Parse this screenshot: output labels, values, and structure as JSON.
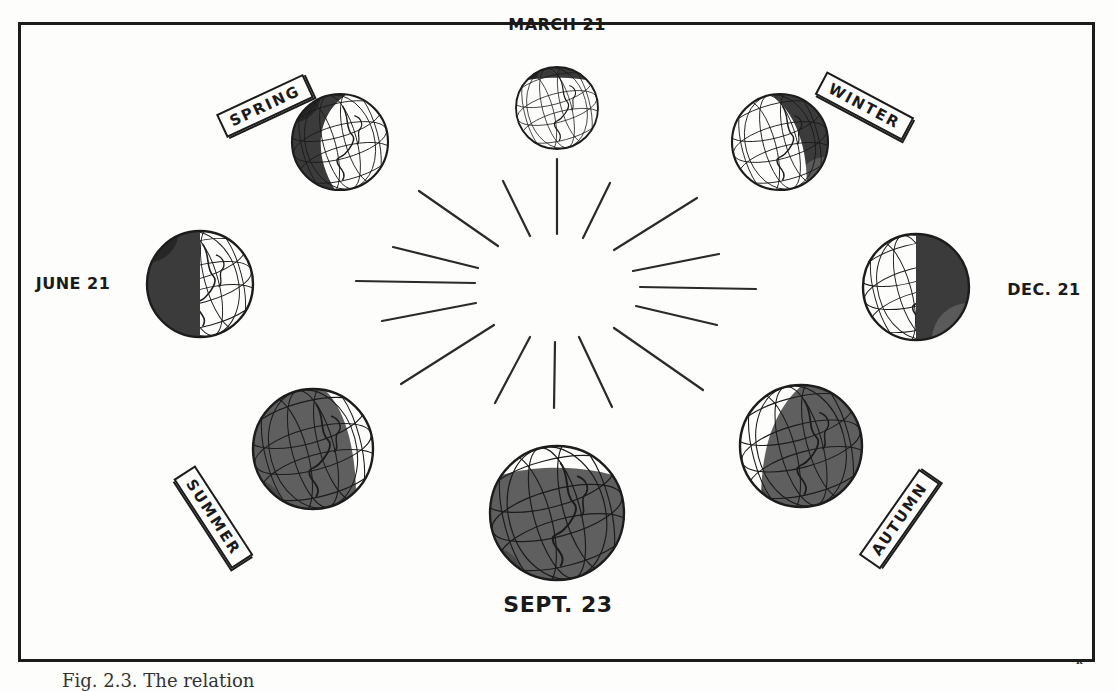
{
  "figure": {
    "type": "diagram",
    "dates": {
      "march": "MARCH 21",
      "june": "JUNE 21",
      "sept": "SEPT. 23",
      "dec": "DEC. 21"
    },
    "seasons": {
      "spring": "SPRING",
      "summer": "SUMMER",
      "autumn": "AUTUMN",
      "winter": "WINTER"
    },
    "corner_mark": "R",
    "caption": "Fig. 2.3. The relation",
    "colors": {
      "ink": "#1c1c1c",
      "night_shade": "#3a3a3a",
      "day_shade": "#5e5e5e",
      "paper": "#fdfdfc"
    },
    "globes": [
      {
        "id": "march",
        "cx": 557,
        "cy": 108,
        "r": 41,
        "shadow": "top-cap"
      },
      {
        "id": "spring",
        "cx": 340,
        "cy": 142,
        "r": 48,
        "shadow": "left-crescent"
      },
      {
        "id": "winter",
        "cx": 780,
        "cy": 142,
        "r": 48,
        "shadow": "right-crescent"
      },
      {
        "id": "june",
        "cx": 200,
        "cy": 284,
        "r": 53,
        "shadow": "left-half"
      },
      {
        "id": "dec",
        "cx": 916,
        "cy": 287,
        "r": 53,
        "shadow": "right-half"
      },
      {
        "id": "summer",
        "cx": 313,
        "cy": 449,
        "r": 60,
        "shadow": "mostly-left"
      },
      {
        "id": "autumn",
        "cx": 801,
        "cy": 446,
        "r": 61,
        "shadow": "mostly-right"
      },
      {
        "id": "sept",
        "cx": 557,
        "cy": 513,
        "r": 67,
        "shadow": "full-bottom"
      }
    ]
  }
}
